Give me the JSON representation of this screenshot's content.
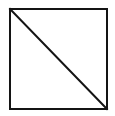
{
  "figure": {
    "title": "Square with one diagonal",
    "canvas": {
      "width": 115,
      "height": 116,
      "background_color": "#ffffff"
    },
    "style": {
      "stroke_color": "#141414",
      "fill_color": "#ffffff",
      "square_stroke_width": 2,
      "diagonal_stroke_width": 2
    },
    "shapes": [
      {
        "name": "square",
        "type": "rect",
        "x": 10,
        "y": 9,
        "width": 97,
        "height": 100,
        "stroke": "#141414",
        "fill": "#ffffff",
        "stroke_width": 2
      },
      {
        "name": "diagonal",
        "type": "line",
        "x1": 10,
        "y1": 9,
        "x2": 107,
        "y2": 109,
        "stroke": "#141414",
        "stroke_width": 2,
        "direction": "top-left-to-bottom-right"
      }
    ],
    "regions": [
      {
        "name": "upper-right-triangle",
        "fill": "#ffffff"
      },
      {
        "name": "lower-left-triangle",
        "fill": "#ffffff"
      }
    ],
    "labels": []
  }
}
